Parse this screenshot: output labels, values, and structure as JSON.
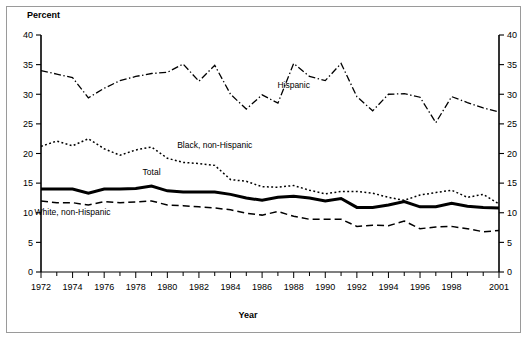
{
  "figure": {
    "ylabel": "Percent",
    "xlabel": "Year",
    "left_axis_label": "Percent"
  },
  "chart_data": {
    "type": "line",
    "title": "",
    "subtitle": "",
    "xlabel": "Year",
    "ylabel": "Percent",
    "xlim": [
      1972,
      2001
    ],
    "ylim": [
      0,
      40
    ],
    "grid": false,
    "legend": "inline-annotations",
    "yticks": [
      0,
      5,
      10,
      15,
      20,
      25,
      30,
      35,
      40
    ],
    "ytick_labels": [
      "0",
      "5",
      "10",
      "15",
      "20",
      "25",
      "30",
      "35",
      "40"
    ],
    "right_axis_yticks": [
      0,
      5,
      10,
      15,
      20,
      25,
      30,
      35,
      40
    ],
    "right_axis_ytick_labels": [
      "0",
      "5",
      "10",
      "15",
      "20",
      "25",
      "30",
      "35",
      "40"
    ],
    "xticks": [
      1972,
      1974,
      1976,
      1978,
      1980,
      1982,
      1984,
      1986,
      1988,
      1990,
      1992,
      1994,
      1996,
      1998,
      2001
    ],
    "xtick_labels": [
      "1972",
      "1974",
      "1976",
      "1978",
      "1980",
      "1982",
      "1984",
      "1986",
      "1988",
      "1990",
      "1992",
      "1994",
      "1996",
      "1998",
      "2001"
    ],
    "x": [
      1972,
      1973,
      1974,
      1975,
      1976,
      1977,
      1978,
      1979,
      1980,
      1981,
      1982,
      1983,
      1984,
      1985,
      1986,
      1987,
      1988,
      1989,
      1990,
      1991,
      1992,
      1993,
      1994,
      1995,
      1996,
      1997,
      1998,
      1999,
      2000,
      2001
    ],
    "series": [
      {
        "name": "Hispanic",
        "style": "dash-dot",
        "label": "Hispanic",
        "values": [
          34.0,
          33.4,
          32.8,
          29.4,
          31.0,
          32.3,
          33.0,
          33.5,
          33.7,
          35.1,
          32.2,
          34.9,
          30.0,
          27.5,
          29.9,
          28.5,
          35.2,
          33.0,
          32.3,
          35.2,
          29.6,
          27.2,
          30.0,
          30.1,
          29.5,
          25.2,
          29.6,
          28.6,
          27.7,
          27.0
        ]
      },
      {
        "name": "Black, non-Hispanic",
        "style": "dotted",
        "label": "Black, non-Hispanic",
        "values": [
          21.2,
          22.1,
          21.3,
          22.5,
          20.8,
          19.7,
          20.6,
          21.1,
          19.2,
          18.5,
          18.3,
          18.0,
          15.6,
          15.3,
          14.4,
          14.3,
          14.6,
          13.8,
          13.2,
          13.6,
          13.6,
          13.3,
          12.6,
          12.1,
          13.0,
          13.4,
          13.8,
          12.6,
          13.1,
          11.5
        ]
      },
      {
        "name": "Total",
        "style": "solid-bold",
        "label": "Total",
        "values": [
          14.0,
          14.0,
          14.0,
          13.3,
          14.0,
          14.0,
          14.1,
          14.5,
          13.7,
          13.5,
          13.5,
          13.5,
          13.1,
          12.5,
          12.1,
          12.6,
          12.8,
          12.5,
          12.0,
          12.4,
          10.9,
          10.9,
          11.3,
          11.9,
          11.0,
          11.0,
          11.6,
          11.1,
          10.9,
          10.8
        ]
      },
      {
        "name": "White, non-Hispanic",
        "style": "dashed",
        "label": "White, non-Hispanic",
        "values": [
          12.0,
          11.7,
          11.7,
          11.3,
          11.9,
          11.7,
          11.8,
          12.0,
          11.3,
          11.2,
          11.0,
          10.8,
          10.5,
          9.9,
          9.6,
          10.2,
          9.4,
          8.9,
          8.9,
          8.9,
          7.7,
          7.9,
          7.8,
          8.6,
          7.3,
          7.6,
          7.7,
          7.3,
          6.8,
          7.0
        ]
      }
    ],
    "annotations": [
      {
        "text": "Hispanic",
        "x": 1988,
        "y": 31.0
      },
      {
        "text": "Black, non-Hispanic",
        "x": 1983,
        "y": 21.0
      },
      {
        "text": "Total",
        "x": 1979,
        "y": 16.3
      },
      {
        "text": "White, non-Hispanic",
        "x": 1974,
        "y": 9.7
      }
    ]
  }
}
